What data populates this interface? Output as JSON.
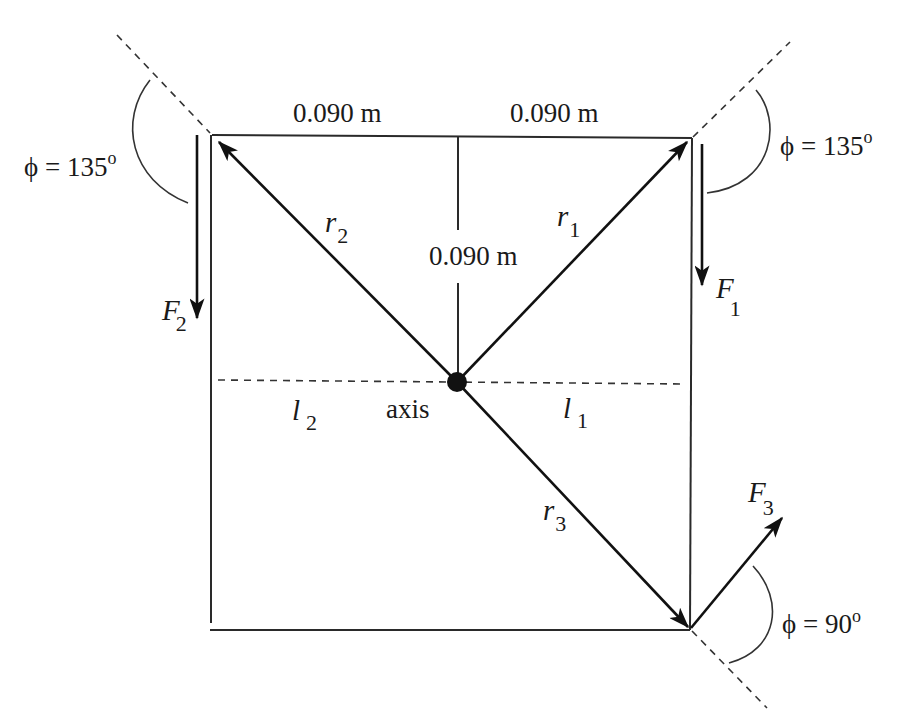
{
  "diagram": {
    "type": "torque-on-square-plate",
    "dimensions": {
      "top_left": "0.090 m",
      "top_right": "0.090 m",
      "vertical": "0.090 m"
    },
    "axis_label": "axis",
    "position_vectors": [
      {
        "symbol": "r",
        "subscript": "1"
      },
      {
        "symbol": "r",
        "subscript": "2"
      },
      {
        "symbol": "r",
        "subscript": "3"
      }
    ],
    "forces": [
      {
        "symbol": "F",
        "subscript": "1"
      },
      {
        "symbol": "F",
        "subscript": "2"
      },
      {
        "symbol": "F",
        "subscript": "3"
      }
    ],
    "lever_arms": [
      {
        "symbol": "l",
        "subscript": "1"
      },
      {
        "symbol": "l",
        "subscript": "2"
      }
    ],
    "angles": {
      "top_left": {
        "symbol": "ϕ",
        "eq": " = ",
        "value": "135",
        "unit": "o"
      },
      "top_right": {
        "symbol": "ϕ",
        "eq": " = ",
        "value": "135",
        "unit": "o"
      },
      "bottom_right": {
        "symbol": "ϕ",
        "eq": " = ",
        "value": "90",
        "unit": "o"
      }
    },
    "colors": {
      "ink": "#111111",
      "background": "#ffffff"
    }
  }
}
